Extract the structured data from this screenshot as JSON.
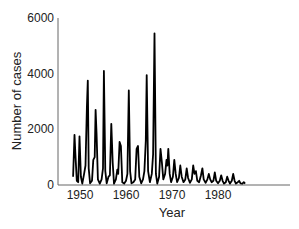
{
  "chart_data": {
    "type": "line",
    "title": "",
    "xlabel": "Year",
    "ylabel": "Number of cases",
    "xlim": [
      1948,
      1988
    ],
    "ylim": [
      0,
      6000
    ],
    "xticks": [
      1950,
      1960,
      1970,
      1980
    ],
    "yticks": [
      0,
      2000,
      4000,
      6000
    ],
    "grid": false,
    "legend": null,
    "series": [
      {
        "name": "cases",
        "color": "#000000",
        "points": [
          [
            1948.5,
            300
          ],
          [
            1948.8,
            1800
          ],
          [
            1949.0,
            1100
          ],
          [
            1949.3,
            150
          ],
          [
            1949.6,
            100
          ],
          [
            1949.9,
            1750
          ],
          [
            1950.2,
            300
          ],
          [
            1950.5,
            50
          ],
          [
            1950.9,
            400
          ],
          [
            1951.2,
            700
          ],
          [
            1951.5,
            2800
          ],
          [
            1951.7,
            3750
          ],
          [
            1951.9,
            600
          ],
          [
            1952.2,
            60
          ],
          [
            1952.6,
            150
          ],
          [
            1952.9,
            900
          ],
          [
            1953.2,
            1000
          ],
          [
            1953.4,
            2700
          ],
          [
            1953.6,
            1800
          ],
          [
            1953.9,
            200
          ],
          [
            1954.3,
            50
          ],
          [
            1954.7,
            200
          ],
          [
            1955.0,
            600
          ],
          [
            1955.2,
            4100
          ],
          [
            1955.5,
            500
          ],
          [
            1955.8,
            60
          ],
          [
            1956.2,
            300
          ],
          [
            1956.5,
            350
          ],
          [
            1956.8,
            2200
          ],
          [
            1957.1,
            800
          ],
          [
            1957.4,
            50
          ],
          [
            1957.8,
            200
          ],
          [
            1958.1,
            550
          ],
          [
            1958.3,
            400
          ],
          [
            1958.6,
            1550
          ],
          [
            1958.9,
            1400
          ],
          [
            1959.2,
            100
          ],
          [
            1959.6,
            50
          ],
          [
            1960.0,
            150
          ],
          [
            1960.3,
            400
          ],
          [
            1960.6,
            3400
          ],
          [
            1960.9,
            500
          ],
          [
            1961.2,
            60
          ],
          [
            1961.6,
            100
          ],
          [
            1962.0,
            200
          ],
          [
            1962.3,
            1300
          ],
          [
            1962.6,
            1400
          ],
          [
            1962.9,
            300
          ],
          [
            1963.3,
            60
          ],
          [
            1963.7,
            200
          ],
          [
            1964.0,
            500
          ],
          [
            1964.3,
            1600
          ],
          [
            1964.5,
            3950
          ],
          [
            1964.8,
            500
          ],
          [
            1965.2,
            100
          ],
          [
            1965.6,
            400
          ],
          [
            1965.9,
            1100
          ],
          [
            1966.2,
            5450
          ],
          [
            1966.5,
            400
          ],
          [
            1966.8,
            50
          ],
          [
            1967.2,
            300
          ],
          [
            1967.5,
            1300
          ],
          [
            1967.8,
            800
          ],
          [
            1968.1,
            200
          ],
          [
            1968.5,
            400
          ],
          [
            1968.8,
            900
          ],
          [
            1969.0,
            700
          ],
          [
            1969.2,
            1300
          ],
          [
            1969.5,
            400
          ],
          [
            1969.8,
            100
          ],
          [
            1970.2,
            300
          ],
          [
            1970.5,
            900
          ],
          [
            1970.8,
            400
          ],
          [
            1971.1,
            100
          ],
          [
            1971.5,
            250
          ],
          [
            1971.8,
            700
          ],
          [
            1972.1,
            300
          ],
          [
            1972.5,
            100
          ],
          [
            1972.9,
            200
          ],
          [
            1973.2,
            600
          ],
          [
            1973.5,
            250
          ],
          [
            1973.9,
            80
          ],
          [
            1974.3,
            200
          ],
          [
            1974.6,
            700
          ],
          [
            1974.9,
            400
          ],
          [
            1975.2,
            500
          ],
          [
            1975.5,
            150
          ],
          [
            1975.9,
            100
          ],
          [
            1976.3,
            350
          ],
          [
            1976.6,
            600
          ],
          [
            1976.9,
            200
          ],
          [
            1977.3,
            80
          ],
          [
            1977.7,
            200
          ],
          [
            1978.0,
            400
          ],
          [
            1978.3,
            200
          ],
          [
            1978.6,
            100
          ],
          [
            1979.0,
            150
          ],
          [
            1979.3,
            450
          ],
          [
            1979.6,
            150
          ],
          [
            1980.0,
            60
          ],
          [
            1980.4,
            150
          ],
          [
            1980.7,
            350
          ],
          [
            1981.0,
            150
          ],
          [
            1981.3,
            50
          ],
          [
            1981.7,
            100
          ],
          [
            1982.0,
            300
          ],
          [
            1982.3,
            150
          ],
          [
            1982.6,
            50
          ],
          [
            1983.0,
            150
          ],
          [
            1983.3,
            400
          ],
          [
            1983.6,
            150
          ],
          [
            1983.9,
            50
          ],
          [
            1984.3,
            100
          ],
          [
            1984.6,
            150
          ],
          [
            1984.9,
            60
          ],
          [
            1985.3,
            50
          ],
          [
            1985.6,
            100
          ],
          [
            1985.9,
            50
          ]
        ]
      }
    ]
  }
}
